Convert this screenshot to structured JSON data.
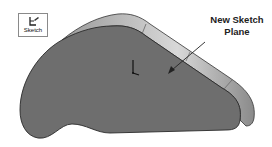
{
  "toolbar": {
    "sketch_button": {
      "label": "Sketch",
      "icon": "sketch-icon"
    }
  },
  "annotation": {
    "callout_line1": "New Sketch",
    "callout_line2": "Plane"
  },
  "colors": {
    "face": "#6e6e6e",
    "edge_side": "#a8a8a8",
    "outline": "#2a2a2a",
    "background": "#ffffff"
  }
}
